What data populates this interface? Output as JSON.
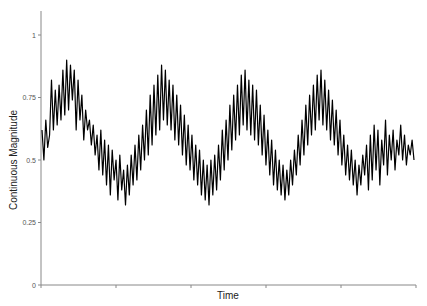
{
  "chart_data": {
    "type": "line",
    "title": "",
    "xlabel": "Time",
    "ylabel": "Continuous Magnitude",
    "ylim": [
      0,
      1.1
    ],
    "yticks": [
      0,
      0.25,
      0.5,
      0.75,
      1
    ],
    "ytick_labels": [
      "0",
      "0.25",
      "0.5",
      "0.75",
      "1"
    ],
    "xtick_count": 6,
    "xtick_labels": [],
    "grid": false,
    "legend": null,
    "line_color": "#000000",
    "series": [
      {
        "name": "Continuous Magnitude",
        "x_range": [
          0,
          199
        ],
        "values": [
          0.62,
          0.5,
          0.66,
          0.55,
          0.6,
          0.82,
          0.62,
          0.78,
          0.64,
          0.8,
          0.66,
          0.86,
          0.68,
          0.9,
          0.7,
          0.88,
          0.74,
          0.86,
          0.62,
          0.82,
          0.66,
          0.76,
          0.58,
          0.7,
          0.62,
          0.66,
          0.56,
          0.64,
          0.52,
          0.6,
          0.46,
          0.62,
          0.44,
          0.58,
          0.4,
          0.56,
          0.36,
          0.54,
          0.42,
          0.5,
          0.34,
          0.52,
          0.38,
          0.46,
          0.32,
          0.48,
          0.36,
          0.52,
          0.4,
          0.56,
          0.42,
          0.6,
          0.46,
          0.64,
          0.5,
          0.7,
          0.52,
          0.76,
          0.56,
          0.8,
          0.6,
          0.84,
          0.62,
          0.88,
          0.66,
          0.86,
          0.64,
          0.82,
          0.62,
          0.8,
          0.58,
          0.76,
          0.56,
          0.72,
          0.52,
          0.68,
          0.48,
          0.64,
          0.46,
          0.6,
          0.42,
          0.56,
          0.4,
          0.54,
          0.36,
          0.5,
          0.34,
          0.48,
          0.32,
          0.5,
          0.36,
          0.52,
          0.38,
          0.56,
          0.42,
          0.62,
          0.46,
          0.66,
          0.5,
          0.72,
          0.54,
          0.76,
          0.58,
          0.8,
          0.6,
          0.84,
          0.64,
          0.86,
          0.62,
          0.82,
          0.6,
          0.8,
          0.58,
          0.78,
          0.56,
          0.72,
          0.52,
          0.68,
          0.48,
          0.62,
          0.44,
          0.58,
          0.4,
          0.54,
          0.38,
          0.5,
          0.36,
          0.48,
          0.34,
          0.46,
          0.36,
          0.5,
          0.4,
          0.54,
          0.44,
          0.6,
          0.48,
          0.66,
          0.52,
          0.72,
          0.56,
          0.76,
          0.6,
          0.8,
          0.62,
          0.84,
          0.66,
          0.86,
          0.64,
          0.82,
          0.62,
          0.78,
          0.58,
          0.74,
          0.56,
          0.7,
          0.52,
          0.66,
          0.48,
          0.6,
          0.44,
          0.56,
          0.42,
          0.54,
          0.4,
          0.5,
          0.36,
          0.48,
          0.4,
          0.52,
          0.44,
          0.56,
          0.38,
          0.6,
          0.42,
          0.64,
          0.46,
          0.62,
          0.4,
          0.58,
          0.48,
          0.66,
          0.44,
          0.6,
          0.5,
          0.62,
          0.46,
          0.58,
          0.52,
          0.64,
          0.5,
          0.6,
          0.48,
          0.56,
          0.52,
          0.58,
          0.5
        ]
      }
    ]
  }
}
